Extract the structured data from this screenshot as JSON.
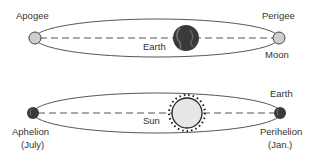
{
  "top_diagram": {
    "labels": {
      "apogee": "Apogee",
      "perigee": "Perigee",
      "earth": "Earth",
      "moon": "Moon"
    }
  },
  "bottom_diagram": {
    "labels": {
      "earth": "Earth",
      "sun": "Sun",
      "aphelion": "Aphelion",
      "aphelion_month": "(July)",
      "perihelion": "Perihelion",
      "perihelion_month": "(Jan.)"
    }
  },
  "colors": {
    "line": "#555555",
    "moon_fill": "#cfcfcf",
    "earth_fill": "#3a3a3a",
    "sun_fill": "#e6e6e6",
    "text": "#333333"
  }
}
